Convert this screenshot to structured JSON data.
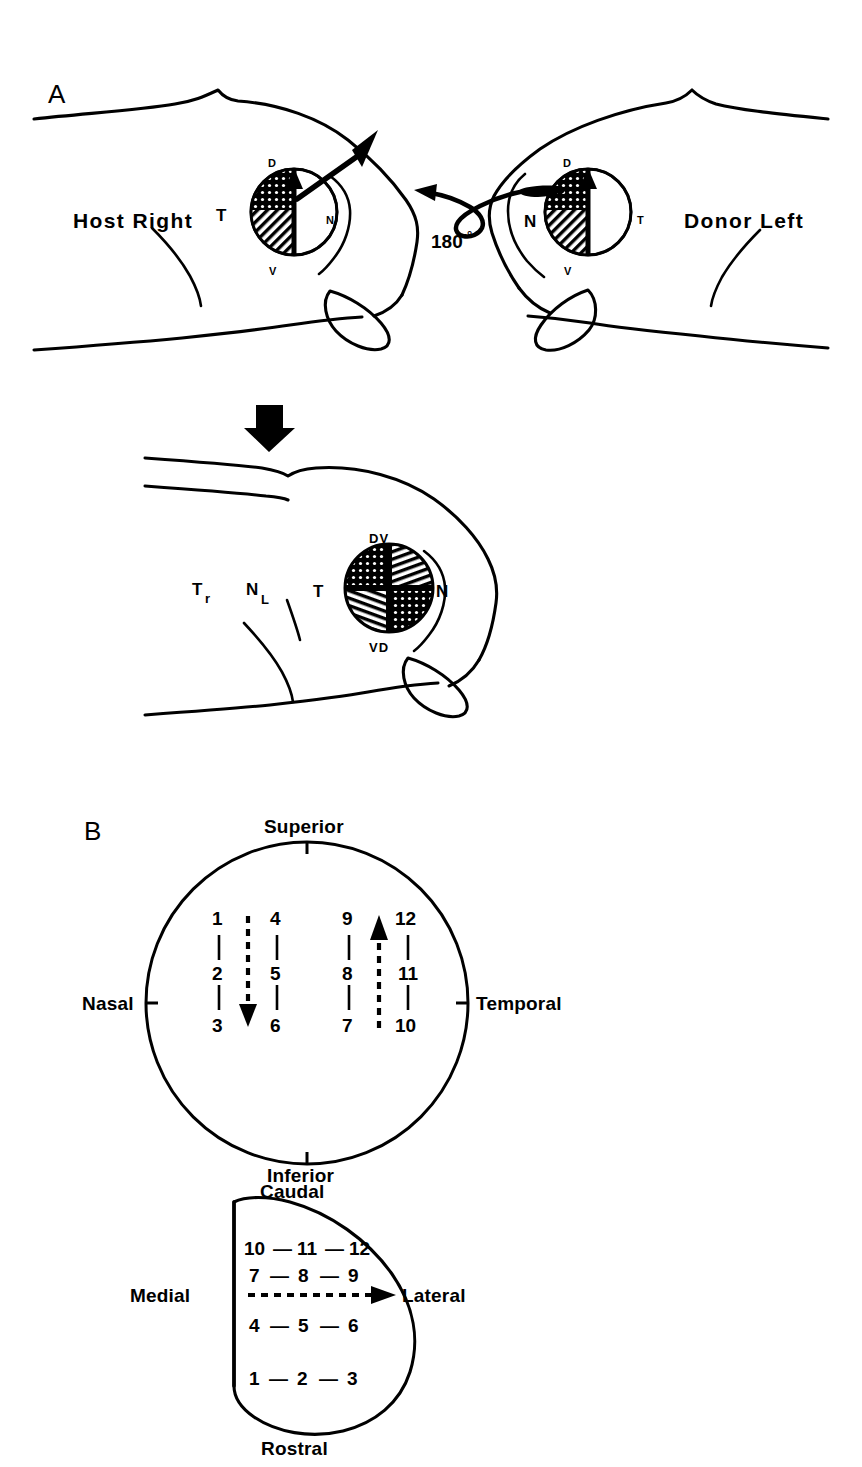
{
  "figure": {
    "panels": [
      {
        "id": "A",
        "letter": "A"
      },
      {
        "id": "B",
        "letter": "B"
      }
    ]
  },
  "panel_a": {
    "letter": "A",
    "host_label": "Host Right",
    "donor_label": "Donor Left",
    "rotation_label": "180",
    "rotation_degree_symbol": "°",
    "host_eye": {
      "dorsal": "D",
      "ventral": "V",
      "temporal": "T",
      "nasal": "N"
    },
    "donor_eye": {
      "dorsal": "D",
      "ventral": "V",
      "temporal": "T",
      "nasal": "N"
    },
    "composite": {
      "top_label": "DV",
      "bottom_label": "VD",
      "temporal": "T",
      "nasal": "N",
      "tectum_rostral": "T",
      "tectum_rostral_sub": "r",
      "nasal_left": "N",
      "nasal_left_sub": "L"
    }
  },
  "panel_b": {
    "letter": "B",
    "retina": {
      "superior": "Superior",
      "inferior": "Inferior",
      "nasal": "Nasal",
      "temporal": "Temporal",
      "columns": [
        {
          "name": "col-1",
          "values": [
            "1",
            "2",
            "3"
          ]
        },
        {
          "name": "col-2",
          "values": [
            "4",
            "5",
            "6"
          ]
        },
        {
          "name": "col-3",
          "values": [
            "9",
            "8",
            "7"
          ]
        },
        {
          "name": "col-4",
          "values": [
            "12",
            "11",
            "10"
          ]
        }
      ],
      "arrows": [
        {
          "name": "down-arrow",
          "direction": "down"
        },
        {
          "name": "up-arrow",
          "direction": "up"
        }
      ]
    },
    "tectum": {
      "caudal": "Caudal",
      "rostral": "Rostral",
      "medial": "Medial",
      "lateral": "Lateral",
      "rows": [
        {
          "name": "row-10-11-12",
          "values": [
            "10",
            "11",
            "12"
          ]
        },
        {
          "name": "row-7-8-9",
          "values": [
            "7",
            "8",
            "9"
          ]
        },
        {
          "name": "row-4-5-6",
          "values": [
            "4",
            "5",
            "6"
          ]
        },
        {
          "name": "row-1-2-3",
          "values": [
            "1",
            "2",
            "3"
          ]
        }
      ],
      "dash": "—",
      "arrow": {
        "name": "medial-lateral-arrow",
        "direction": "right"
      }
    }
  },
  "colors": {
    "ink": "#000000",
    "background": "#ffffff"
  }
}
